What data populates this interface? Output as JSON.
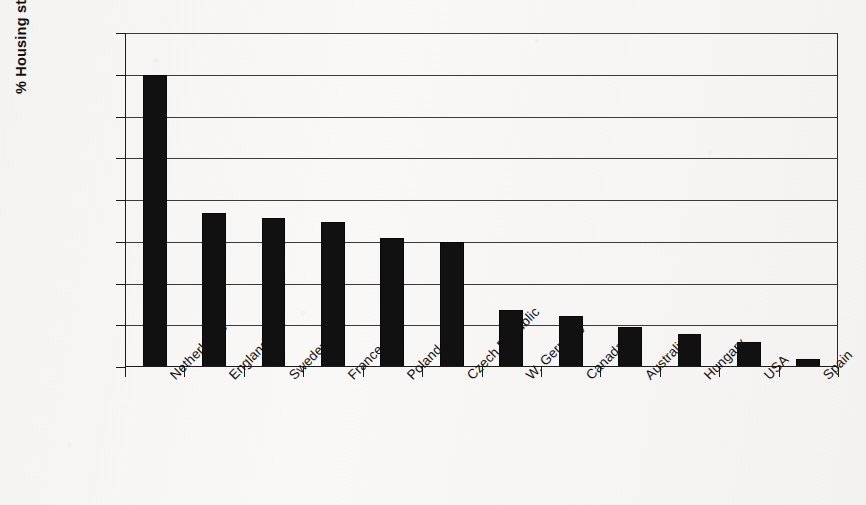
{
  "chart_data": {
    "type": "bar",
    "title": "",
    "xlabel": "",
    "ylabel": "% Housing stock",
    "ylim": [
      0,
      40
    ],
    "ytick_values": [
      0,
      5,
      10,
      15,
      20,
      25,
      30,
      35,
      40
    ],
    "ytick_labels": [
      "0",
      "5",
      "10",
      "15",
      "20",
      "25",
      "30",
      "35",
      "40"
    ],
    "grid": true,
    "legend": "none",
    "bar_color": "#111111",
    "background_color": "#f7f6f4",
    "categories": [
      "Netherlands",
      "England",
      "Sweden",
      "France",
      "Poland",
      "Czech Republic",
      "W. Germany",
      "Canada",
      "Australia",
      "Hungary",
      "USA",
      "Spain"
    ],
    "values": [
      35.0,
      18.5,
      17.8,
      17.4,
      15.5,
      15.0,
      6.8,
      6.1,
      4.8,
      4.0,
      3.0,
      1.0
    ]
  }
}
